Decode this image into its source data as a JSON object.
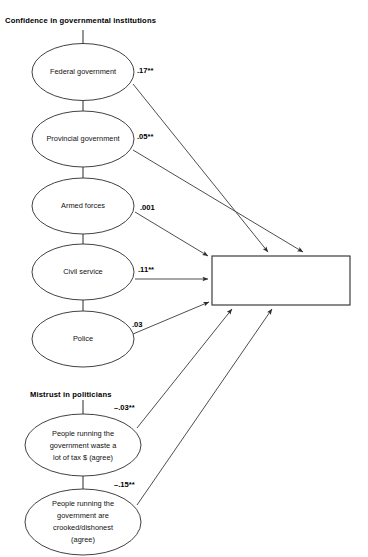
{
  "diagram": {
    "groups": [
      {
        "id": "confidence",
        "label": "Confidence in governmental institutions"
      },
      {
        "id": "mistrust",
        "label": "Mistrust in politicians"
      }
    ],
    "predictors": [
      {
        "id": "federal",
        "label": "Federal government",
        "coefficient": ".17**"
      },
      {
        "id": "provincial",
        "label": "Provincial government",
        "coefficient": ".05**"
      },
      {
        "id": "armed-forces",
        "label": "Armed forces",
        "coefficient": ".001"
      },
      {
        "id": "civil-service",
        "label": "Civil service",
        "coefficient": ".11**"
      },
      {
        "id": "police",
        "label": "Police",
        "coefficient": ".03"
      },
      {
        "id": "waste-tax",
        "label": "People running the government waste a lot of tax $ (agree)",
        "label_lines": [
          "People running the",
          "government waste a",
          "lot of tax $ (agree)"
        ],
        "coefficient": "–.03**"
      },
      {
        "id": "crooked",
        "label": "People running the government are crooked/dishonest (agree)",
        "label_lines": [
          "People running the",
          "government are",
          "crooked/dishonest",
          "(agree)"
        ],
        "coefficient": "–.15**"
      }
    ],
    "outcome": {
      "id": "elected-officials",
      "label": "Elected officials soon lose touch with people (disagree)",
      "label_lines": [
        "Elected officials soon lose",
        "touch with people (disagree)"
      ]
    },
    "colors": {
      "stroke": "#2b2b2b",
      "text": "#111111",
      "background": "#ffffff"
    }
  }
}
